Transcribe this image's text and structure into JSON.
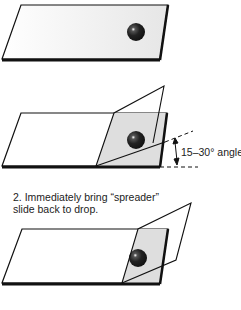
{
  "diagram": {
    "panels": [
      {
        "id": "slide-with-drop",
        "label": ""
      },
      {
        "id": "spreader-at-angle",
        "annotation": "15–30° angle"
      },
      {
        "id": "spreader-back-to-drop",
        "caption": "2. Immediately bring “spreader” slide back to drop."
      }
    ],
    "angle_label": "15–30° angle",
    "step2_line1": "2. Immediately bring “spreader”",
    "step2_line2": "slide back to drop.",
    "colors": {
      "outline": "#111111",
      "drop": "#1a1a1a",
      "slide_fill": "#f4f4f4",
      "overlap_fill": "#d9d9d9"
    }
  }
}
